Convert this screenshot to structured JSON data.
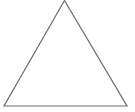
{
  "diagram": {
    "shape": "triangle",
    "type": "equilateral",
    "fill": "none",
    "stroke_color": "#6b6b6b",
    "stroke_width": 1.2,
    "background": "#ffffff",
    "vertices": {
      "apex": [
        64.5,
        0.5
      ],
      "bottom_left": [
        4,
        106
      ],
      "bottom_right": [
        127,
        106
      ]
    }
  }
}
